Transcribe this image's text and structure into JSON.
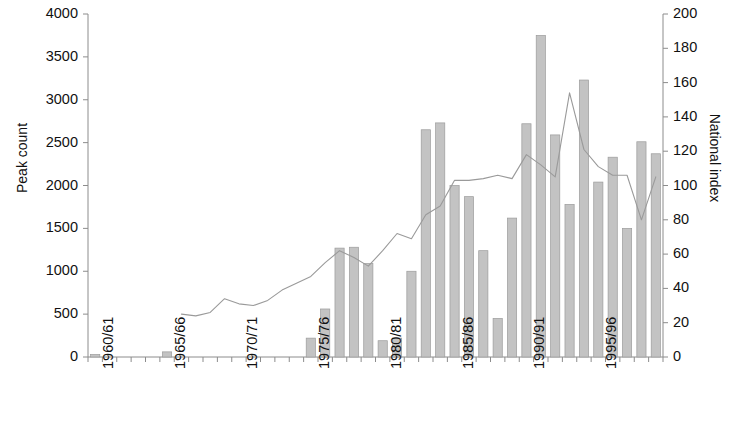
{
  "chart_data": {
    "type": "bar",
    "title": "",
    "subtitle": "",
    "xlabel": "",
    "ylabel": "Peak count",
    "y2label": "National index",
    "grid": false,
    "legend": false,
    "ylim": [
      0,
      4000
    ],
    "y2lim": [
      0,
      200
    ],
    "y_ticks": [
      "0",
      "500",
      "1000",
      "1500",
      "2000",
      "2500",
      "3000",
      "3500",
      "4000"
    ],
    "y2_ticks": [
      "0",
      "20",
      "40",
      "60",
      "80",
      "100",
      "120",
      "140",
      "160",
      "180",
      "200"
    ],
    "x_tick_labels": [
      "1960/61",
      "1965/66",
      "1970/71",
      "1975/76",
      "1980/81",
      "1985/86",
      "1990/91",
      "1995/96"
    ],
    "x_tick_indices": [
      0,
      5,
      10,
      15,
      20,
      25,
      30,
      35
    ],
    "categories": [
      "1960/61",
      "1961/62",
      "1962/63",
      "1963/64",
      "1964/65",
      "1965/66",
      "1966/67",
      "1967/68",
      "1968/69",
      "1969/70",
      "1970/71",
      "1971/72",
      "1972/73",
      "1973/74",
      "1974/75",
      "1975/76",
      "1976/77",
      "1977/78",
      "1978/79",
      "1979/80",
      "1980/81",
      "1981/82",
      "1982/83",
      "1983/84",
      "1984/85",
      "1985/86",
      "1986/87",
      "1987/88",
      "1988/89",
      "1989/90",
      "1990/91",
      "1991/92",
      "1992/93",
      "1993/94",
      "1994/95",
      "1995/96",
      "1996/97",
      "1997/98",
      "1998/99",
      "1999/00"
    ],
    "series": [
      {
        "name": "Peak count",
        "type": "bar",
        "axis": "left",
        "color": "#c3c3c3",
        "values": [
          30,
          0,
          0,
          0,
          0,
          60,
          0,
          0,
          0,
          0,
          0,
          0,
          0,
          0,
          0,
          220,
          560,
          1270,
          1280,
          1090,
          190,
          220,
          1000,
          2650,
          2730,
          2000,
          1870,
          1240,
          450,
          1620,
          2720,
          3750,
          2590,
          1780,
          3230,
          2040,
          2330,
          1500,
          2510,
          2370
        ]
      },
      {
        "name": "National index",
        "type": "line",
        "axis": "right",
        "color": "#9a9a9a",
        "start_index": 6,
        "values": [
          null,
          null,
          null,
          null,
          null,
          null,
          25,
          24,
          26,
          34,
          31,
          30,
          33,
          39,
          43,
          47,
          55,
          62,
          58,
          53,
          62,
          72,
          69,
          83,
          88,
          103,
          103,
          104,
          106,
          104,
          118,
          112,
          105,
          154,
          121,
          111,
          106,
          106,
          80,
          105
        ]
      }
    ]
  }
}
